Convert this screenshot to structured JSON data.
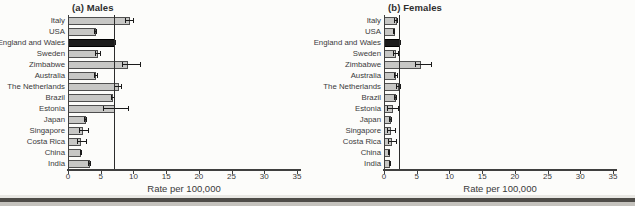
{
  "colors": {
    "bar_fill": "#c7c7c5",
    "bar_border": "#4f4f4f",
    "highlight_fill": "#1b1b1b",
    "axis": "#3f3f3f",
    "error_bar": "#1a1a1a",
    "text": "#3a3a3a",
    "background": "#fcfcfa",
    "bottom_band": "#4e4c48"
  },
  "chart_data": [
    {
      "type": "bar",
      "orientation": "horizontal",
      "title": "(a) Males",
      "xlabel": "Rate per 100,000",
      "xlim": [
        0,
        35
      ],
      "xticks": [
        0,
        5,
        10,
        15,
        20,
        25,
        30,
        35
      ],
      "grid": false,
      "reference_line_x": 7.0,
      "highlight_category": "England and Wales",
      "categories": [
        "Italy",
        "USA",
        "England and Wales",
        "Sweden",
        "Zimbabwe",
        "Australia",
        "The Netherlands",
        "Brazil",
        "Estonia",
        "Japan",
        "Singapore",
        "Costa Rica",
        "China",
        "India"
      ],
      "values": [
        9.3,
        4.1,
        7.0,
        4.5,
        9.0,
        4.2,
        7.6,
        6.8,
        7.1,
        2.6,
        2.2,
        1.9,
        1.9,
        3.2
      ],
      "error_low": [
        8.7,
        3.9,
        6.8,
        4.1,
        8.3,
        3.9,
        7.1,
        6.5,
        5.3,
        2.4,
        1.7,
        1.4,
        1.8,
        3.0
      ],
      "error_high": [
        9.9,
        4.3,
        7.2,
        4.9,
        11.0,
        4.5,
        8.1,
        7.1,
        9.1,
        2.8,
        3.1,
        2.7,
        2.0,
        3.4
      ]
    },
    {
      "type": "bar",
      "orientation": "horizontal",
      "title": "(b) Females",
      "xlabel": "Rate per 100,000",
      "xlim": [
        0,
        35
      ],
      "xticks": [
        0,
        5,
        10,
        15,
        20,
        25,
        30,
        35
      ],
      "grid": false,
      "reference_line_x": 2.3,
      "highlight_category": "England and Wales",
      "categories": [
        "Italy",
        "USA",
        "England and Wales",
        "Sweden",
        "Zimbabwe",
        "Australia",
        "The Netherlands",
        "Brazil",
        "Estonia",
        "Japan",
        "Singapore",
        "Costa Rica",
        "China",
        "India"
      ],
      "values": [
        1.8,
        1.5,
        2.3,
        1.7,
        5.5,
        1.7,
        2.1,
        1.7,
        1.2,
        0.9,
        0.9,
        1.0,
        0.7,
        0.8
      ],
      "error_low": [
        1.6,
        1.4,
        2.2,
        1.3,
        4.8,
        1.5,
        1.8,
        1.5,
        0.4,
        0.8,
        0.5,
        0.6,
        0.6,
        0.7
      ],
      "error_high": [
        2.0,
        1.6,
        2.4,
        2.2,
        7.2,
        2.0,
        2.4,
        1.9,
        2.2,
        1.0,
        1.7,
        1.8,
        0.8,
        0.9
      ]
    }
  ]
}
